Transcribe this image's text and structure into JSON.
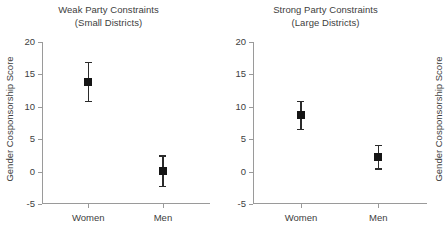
{
  "chart_data": {
    "type": "scatter",
    "title": "",
    "xlabel": "",
    "ylabel": "Gender Cosponsorship Score",
    "ylim": [
      -5,
      20
    ],
    "yticks": [
      20,
      15,
      10,
      5,
      0,
      -5
    ],
    "ytick_labels": [
      "20",
      "15",
      "10",
      "5",
      "0",
      "-5"
    ],
    "categories": [
      "Women",
      "Men"
    ],
    "grid": false,
    "legend": "none",
    "marker": "filled-square",
    "error_bars": "vertical-with-caps",
    "panels": [
      {
        "title_line1": "Weak Party Constraints",
        "title_line2": "(Small Districts)",
        "ylabel": "Gender Cosponsorship Score",
        "categories": [
          "Women",
          "Men"
        ],
        "points": [
          {
            "category": "Women",
            "value": 13.8,
            "low": 10.9,
            "high": 16.9
          },
          {
            "category": "Men",
            "value": 0.1,
            "low": -2.2,
            "high": 2.5
          }
        ]
      },
      {
        "title_line1": "Strong Party Constraints",
        "title_line2": "(Large Districts)",
        "ylabel": "Gender Cosponsorship Score",
        "categories": [
          "Women",
          "Men"
        ],
        "points": [
          {
            "category": "Women",
            "value": 8.7,
            "low": 6.6,
            "high": 10.9
          },
          {
            "category": "Men",
            "value": 2.3,
            "low": 0.5,
            "high": 4.1
          }
        ]
      }
    ]
  },
  "style": {
    "background": "#ffffff",
    "axis_color": "#9a9a9a",
    "text_color": "#404040",
    "marker_color": "#151515"
  }
}
